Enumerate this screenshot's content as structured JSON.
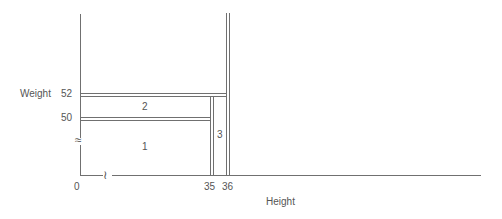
{
  "diagram": {
    "y_axis": {
      "label": "Weight",
      "ticks": [
        "52",
        "50"
      ],
      "break_symbol": "≈"
    },
    "x_axis": {
      "label": "Height",
      "ticks": [
        "0",
        "35",
        "36"
      ],
      "break_symbol": "≀"
    },
    "regions": [
      {
        "id": "1",
        "label": "1"
      },
      {
        "id": "2",
        "label": "2"
      },
      {
        "id": "3",
        "label": "3"
      }
    ],
    "colors": {
      "line": "#666666",
      "text": "#555555",
      "background": "#ffffff"
    }
  }
}
